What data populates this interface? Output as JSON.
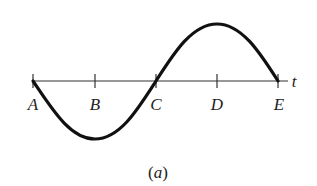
{
  "figure": {
    "caption_open": "(",
    "caption_letter": "a",
    "caption_close": ")",
    "axis_label": "t",
    "points": [
      {
        "label": "A",
        "x": 33
      },
      {
        "label": "B",
        "x": 95
      },
      {
        "label": "C",
        "x": 156
      },
      {
        "label": "D",
        "x": 217
      },
      {
        "label": "E",
        "x": 278
      }
    ],
    "axis": {
      "y": 81,
      "x_start": 33,
      "x_end": 288
    },
    "curve": {
      "type": "sine",
      "description": "One full period starting at A going negative, trough at B, zero at C, peak at D, zero at E",
      "trough_y": 139,
      "peak_y": 24
    },
    "colors": {
      "line": "#222222",
      "curve": "#111111",
      "background": "#ffffff"
    }
  }
}
